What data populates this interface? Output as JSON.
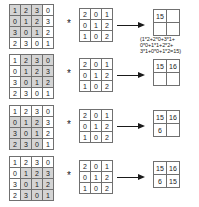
{
  "diagram": {
    "operator_symbol": "*",
    "arrow_symbol": "arrow-right",
    "input_matrix": {
      "label": "input feature map",
      "rows": 4,
      "cols": 4,
      "values": [
        [
          1,
          2,
          3,
          0
        ],
        [
          0,
          1,
          2,
          3
        ],
        [
          3,
          0,
          1,
          2
        ],
        [
          2,
          3,
          0,
          1
        ]
      ]
    },
    "kernel_matrix": {
      "label": "kernel",
      "rows": 3,
      "cols": 3,
      "values": [
        [
          2,
          0,
          1
        ],
        [
          0,
          1,
          2
        ],
        [
          1,
          0,
          2
        ]
      ]
    },
    "highlight_color": "#d4d4d4",
    "border_color": "#707070",
    "steps": [
      {
        "step": 1,
        "highlight_origin": {
          "row": 0,
          "col": 0
        },
        "output": [
          [
            "15",
            ""
          ],
          [
            "",
            ""
          ]
        ],
        "calculation": [
          "(1*2+2*0+3*1+",
          "0*0+1*1+2*2+",
          "3*1+0*0+1*2=15)"
        ]
      },
      {
        "step": 2,
        "highlight_origin": {
          "row": 0,
          "col": 1
        },
        "output": [
          [
            "15",
            "16"
          ],
          [
            "",
            ""
          ]
        ],
        "calculation": []
      },
      {
        "step": 3,
        "highlight_origin": {
          "row": 1,
          "col": 0
        },
        "output": [
          [
            "15",
            "16"
          ],
          [
            "6",
            ""
          ]
        ],
        "calculation": []
      },
      {
        "step": 4,
        "highlight_origin": {
          "row": 1,
          "col": 1
        },
        "output": [
          [
            "15",
            "16"
          ],
          [
            "6",
            "15"
          ]
        ],
        "calculation": []
      }
    ]
  }
}
